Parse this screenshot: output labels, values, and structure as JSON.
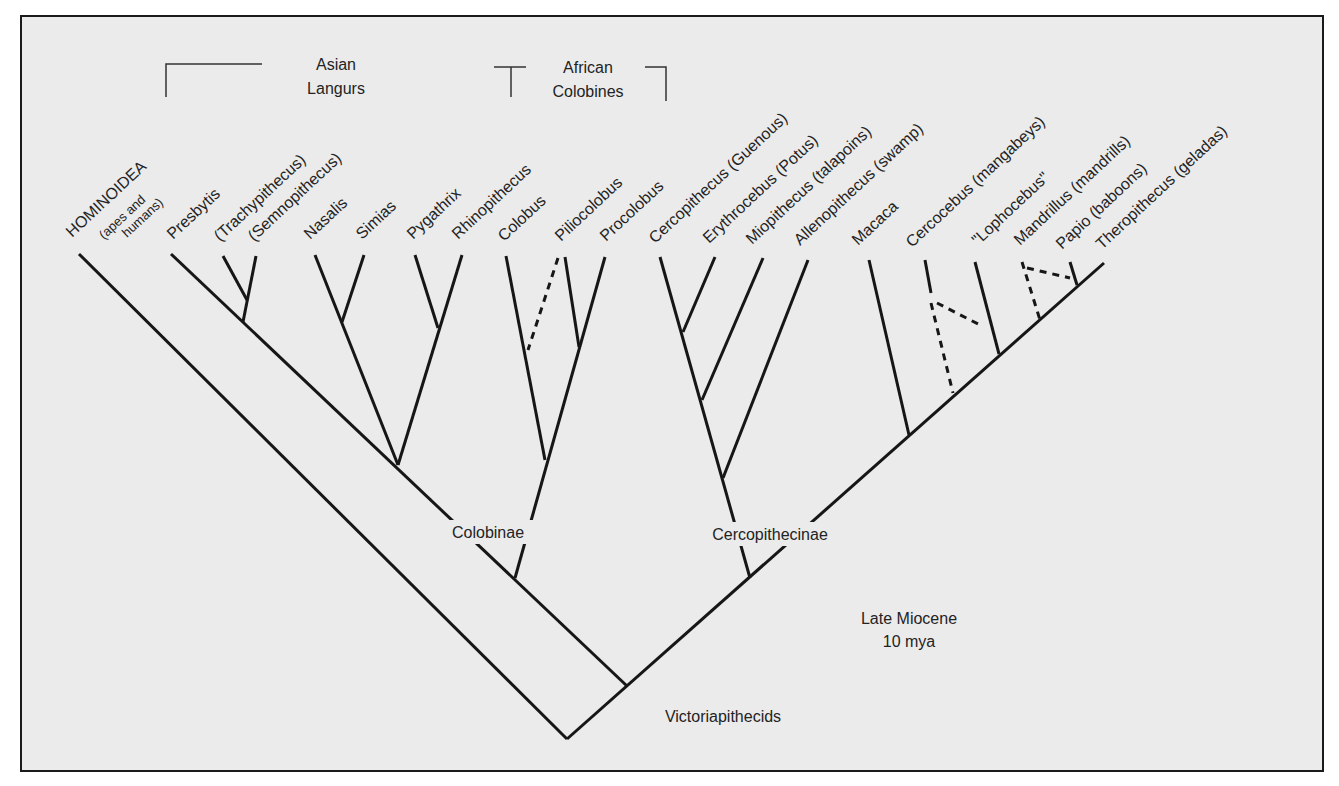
{
  "diagram": {
    "type": "phylogenetic-tree",
    "groups": [
      {
        "id": "asian",
        "line1": "Asian",
        "line2": "Langurs"
      },
      {
        "id": "african",
        "line1": "African",
        "line2": "Colobines"
      }
    ],
    "taxa": [
      {
        "id": "hominoidea",
        "label": "HOMINOIDEA",
        "sub1": "(apes and",
        "sub2": "humans)"
      },
      {
        "id": "presbytis",
        "label": "Presbytis"
      },
      {
        "id": "trachypithecus",
        "label": "(Trachypithecus)"
      },
      {
        "id": "semnopithecus",
        "label": "(Semnopithecus)"
      },
      {
        "id": "nasalis",
        "label": "Nasalis"
      },
      {
        "id": "simias",
        "label": "Simias"
      },
      {
        "id": "pygathrix",
        "label": "Pygathrix"
      },
      {
        "id": "rhinopithecus",
        "label": "Rhinopithecus"
      },
      {
        "id": "colobus",
        "label": "Colobus"
      },
      {
        "id": "piliocolobus",
        "label": "Piliocolobus"
      },
      {
        "id": "procolobus",
        "label": "Procolobus"
      },
      {
        "id": "cercopithecus",
        "label": "Cercopithecus (Guenous)"
      },
      {
        "id": "erythrocebus",
        "label": "Erythrocebus (Potus)"
      },
      {
        "id": "miopithecus",
        "label": "Miopithecus (talapoins)"
      },
      {
        "id": "allenopithecus",
        "label": "Allenopithecus (swamp)"
      },
      {
        "id": "macaca",
        "label": "Macaca"
      },
      {
        "id": "cercocebus",
        "label": "Cercocebus (mangabeys)"
      },
      {
        "id": "lophocebus",
        "label": "\"Lophocebus\""
      },
      {
        "id": "mandrillus",
        "label": "Mandrillus (mandrills)"
      },
      {
        "id": "papio",
        "label": "Papio (baboons)"
      },
      {
        "id": "theropithecus",
        "label": "Theropithecus (geladas)"
      }
    ],
    "clades": {
      "colobinae": "Colobinae",
      "cercopithecinae": "Cercopithecinae",
      "victoriapithecids": "Victoriapithecids"
    },
    "time": {
      "line1": "Late Miocene",
      "line2": "10 mya"
    }
  }
}
